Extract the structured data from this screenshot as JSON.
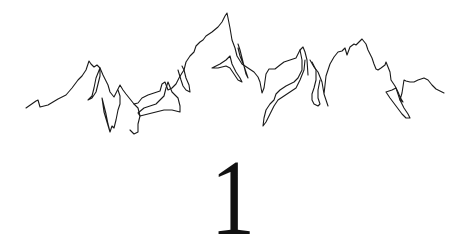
{
  "illustration": {
    "type": "mountain-range-line-drawing",
    "stroke_color": "#1a1a1a"
  },
  "numeral": {
    "text": "1",
    "color": "#111111"
  },
  "background": "#ffffff"
}
